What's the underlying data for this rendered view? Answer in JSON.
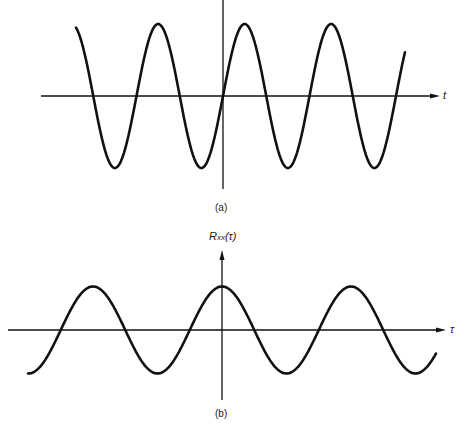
{
  "panel_a": {
    "caption": "(a)",
    "x_axis_label": "t",
    "description": "Sinusoid x(t) passing through origin going upward",
    "curve": {
      "x_start": 76,
      "x_end": 405,
      "axis_y": 96,
      "amplitude": 72,
      "period": 86.5,
      "zero_cross_up_x": 223
    },
    "axis": {
      "h_x1": 41,
      "h_x2": 440,
      "v_x": 223,
      "v_y1": 0,
      "v_y2": 189
    }
  },
  "panel_b": {
    "caption": "(b)",
    "y_axis_label_main": "R",
    "y_axis_label_sub": "xx",
    "y_axis_label_arg": "(τ)",
    "x_axis_label": "τ",
    "description": "Autocorrelation Rxx(τ), cosine with maximum at τ = 0",
    "curve": {
      "x_start": 28,
      "x_end": 436,
      "axis_y": 330,
      "amplitude": 43.5,
      "period": 129,
      "peak_x": 222
    },
    "axis": {
      "h_x1": 8,
      "h_x2": 446,
      "v_x": 222,
      "v_y1": 250,
      "v_y2": 400
    }
  },
  "colors": {
    "line": "#111111",
    "background": "#ffffff"
  }
}
